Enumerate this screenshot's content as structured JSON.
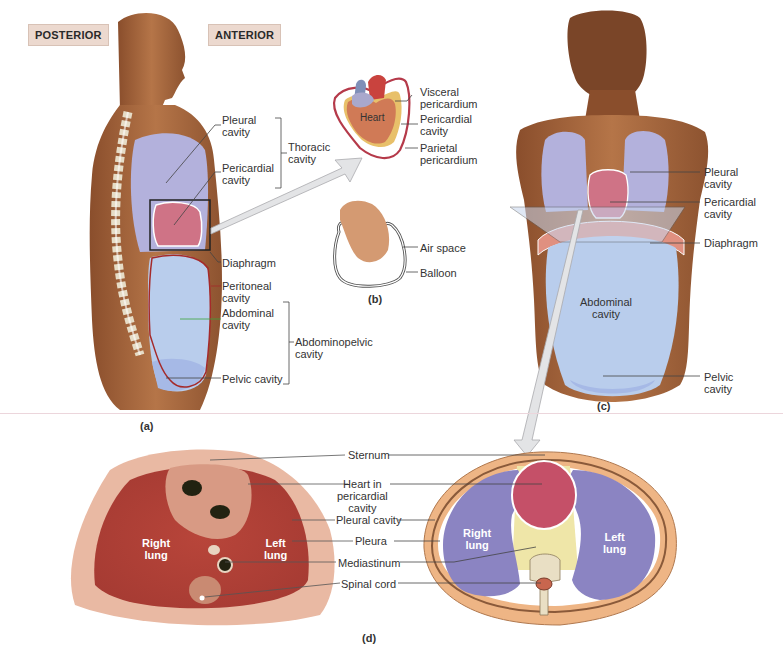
{
  "figure": {
    "orientation_tags": {
      "posterior": "POSTERIOR",
      "anterior": "ANTERIOR"
    },
    "panels": {
      "a": "(a)",
      "b": "(b)",
      "c": "(c)",
      "d": "(d)"
    },
    "panel_a": {
      "labels": {
        "pleural_cavity": [
          "Pleural",
          "cavity"
        ],
        "pericardial_cavity": [
          "Pericardial",
          "cavity"
        ],
        "thoracic_cavity": [
          "Thoracic",
          "cavity"
        ],
        "diaphragm": "Diaphragm",
        "peritoneal_cavity": [
          "Peritoneal",
          "cavity"
        ],
        "abdominal_cavity": [
          "Abdominal",
          "cavity"
        ],
        "abdominopelvic_cavity": [
          "Abdominopelvic",
          "cavity"
        ],
        "pelvic_cavity": "Pelvic cavity"
      }
    },
    "panel_b_heart": {
      "heart": "Heart",
      "visceral_pericardium": [
        "Visceral",
        "pericardium"
      ],
      "pericardial_cavity": [
        "Pericardial",
        "cavity"
      ],
      "parietal_pericardium": [
        "Parietal",
        "pericardium"
      ]
    },
    "panel_b_balloon": {
      "air_space": "Air space",
      "balloon": "Balloon"
    },
    "panel_c": {
      "pleural_cavity": [
        "Pleural",
        "cavity"
      ],
      "pericardial_cavity": [
        "Pericardial",
        "cavity"
      ],
      "diaphragm": "Diaphragm",
      "abdominal_cavity": [
        "Abdominal",
        "cavity"
      ],
      "pelvic_cavity": [
        "Pelvic",
        "cavity"
      ]
    },
    "panel_d": {
      "sternum": "Sternum",
      "heart_in_pericardial_cavity": [
        "Heart in",
        "pericardial",
        "cavity"
      ],
      "pleural_cavity": "Pleural cavity",
      "pleura": "Pleura",
      "mediastinum": "Mediastinum",
      "spinal_cord": "Spinal cord",
      "right_lung": [
        "Right",
        "lung"
      ],
      "left_lung": [
        "Left",
        "lung"
      ]
    },
    "colors": {
      "pleural": "#b3b1dc",
      "pericardial": "#cf7386",
      "abdominal": "#b9cdec",
      "skin": "#a8643a",
      "peritoneal_line": "#a52a2a",
      "abdominal_line": "#3aa33a",
      "mediastinum": "#efe6a8",
      "tag_bg": "#ecd9cf"
    }
  }
}
